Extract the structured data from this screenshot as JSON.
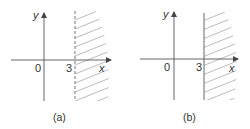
{
  "figure": {
    "panels": [
      {
        "id": "a",
        "caption": "(a)",
        "axis_x_label": "x",
        "axis_y_label": "y",
        "origin_label": "0",
        "boundary_value_label": "3",
        "boundary_style": "dashed",
        "shaded_region": "x > 3"
      },
      {
        "id": "b",
        "caption": "(b)",
        "axis_x_label": "x",
        "axis_y_label": "y",
        "origin_label": "0",
        "boundary_value_label": "3",
        "boundary_style": "solid",
        "shaded_region": "x ≥ 3"
      }
    ],
    "colors": {
      "axis": "#555555",
      "boundary": "#666666",
      "hatch": "#aaaaaa",
      "text": "#333333"
    }
  }
}
